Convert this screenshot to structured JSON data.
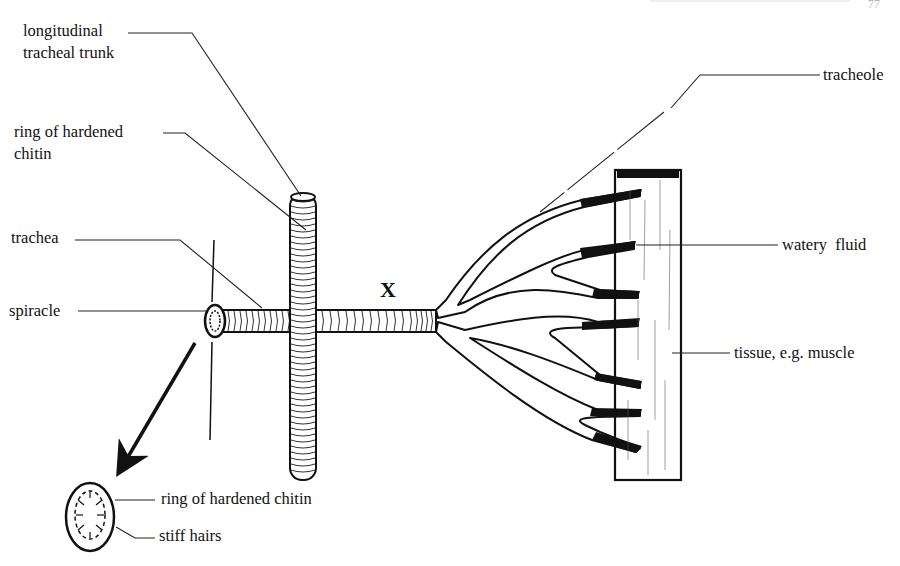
{
  "page_header": {
    "page_number": "77"
  },
  "diagram": {
    "center_label": "X",
    "labels": {
      "longitudinal_trunk_line1": "longitudinal",
      "longitudinal_trunk_line2": "tracheal trunk",
      "ring_chitin_line1": "ring of hardened",
      "ring_chitin_line2": "chitin",
      "trachea": "trachea",
      "spiracle": "spiracle",
      "tracheole": "tracheole",
      "watery_fluid": "watery  fluid",
      "tissue": "tissue, e.g. muscle",
      "inset_ring": "ring of hardened chitin",
      "inset_hairs": "stiff hairs"
    },
    "parts": [
      "longitudinal tracheal trunk",
      "ring of hardened chitin",
      "trachea",
      "spiracle",
      "tracheole",
      "watery fluid",
      "tissue, e.g. muscle",
      "stiff hairs"
    ],
    "colors": {
      "ink": "#111111",
      "background": "#ffffff"
    }
  }
}
